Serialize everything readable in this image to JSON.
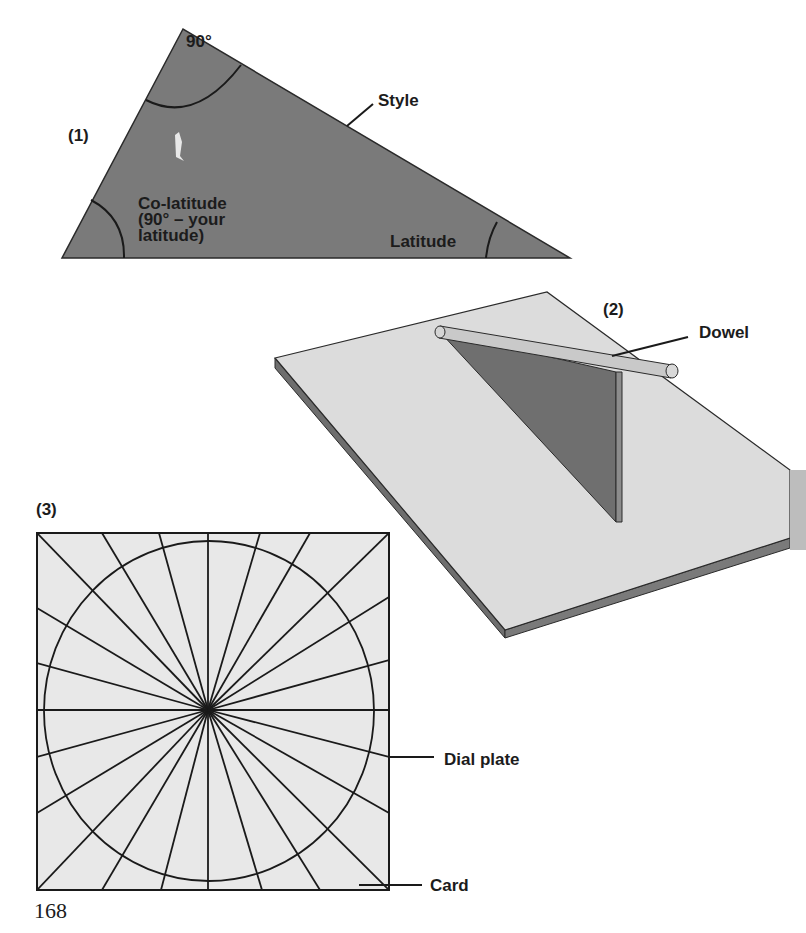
{
  "page": {
    "number": "168"
  },
  "figures": [
    {
      "id": "1",
      "label": "(1)",
      "title": "Triangular style template",
      "angle_labels": {
        "right_angle": "90°",
        "co_latitude": "Co-latitude\n(90° – your\nlatitude)",
        "latitude": "Latitude"
      },
      "callouts": {
        "style": "Style"
      }
    },
    {
      "id": "2",
      "label": "(2)",
      "title": "Style mounted on board",
      "callouts": {
        "dowel": "Dowel"
      }
    },
    {
      "id": "3",
      "label": "(3)",
      "title": "Dial plate on card",
      "hour_lines": 24,
      "callouts": {
        "dial_plate": "Dial plate",
        "card": "Card"
      }
    }
  ],
  "colors": {
    "triangle_fill": "#7a7a7a",
    "board_top": "#dcdcdc",
    "board_edge": "#6e6e6e",
    "card_fill": "#e8e8e8",
    "line": "#2a2a2a",
    "dowel": "#c9c9c9"
  }
}
